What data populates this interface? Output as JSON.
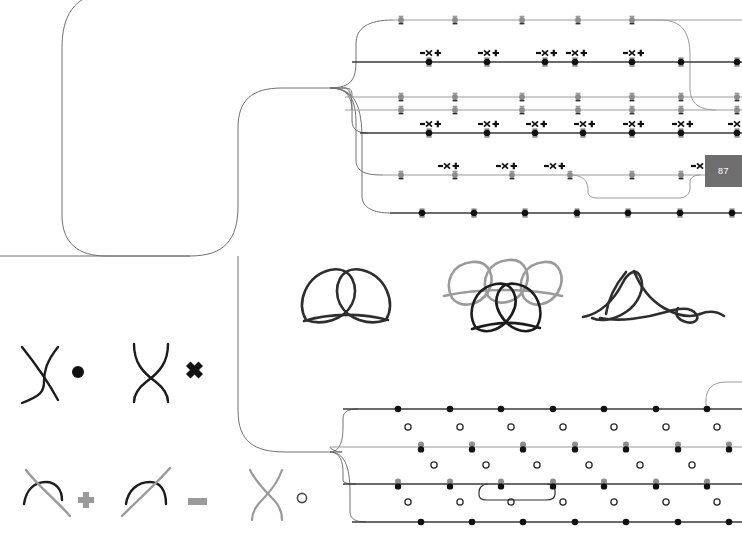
{
  "diagram": {
    "background": "#ffffff",
    "colors": {
      "track_dark": "#3a3a3a",
      "track_light": "#9a9a9a",
      "connector": "#707070",
      "marker_dark": "#1a1a1a",
      "marker_gray": "#8c8c8c",
      "glyph_dark": "#111111",
      "glyph_gray": "#9a9a9a",
      "badge_fill": "#6e6e6e",
      "badge_text": "#ffffff",
      "open_circle": "#2a2a2a"
    }
  },
  "badge": {
    "label": "87",
    "x": 705,
    "y": 155,
    "width": 37,
    "height": 32
  },
  "legend": {
    "rows": [
      {
        "entries": [
          {
            "name": "crossing-over-dark",
            "symbol": "dot",
            "symbol_char": "●",
            "tone": "dark"
          },
          {
            "name": "crossing-under-dark",
            "symbol": "cross",
            "symbol_char": "✖",
            "tone": "dark"
          }
        ]
      },
      {
        "entries": [
          {
            "name": "crossing-plus",
            "symbol": "plus",
            "symbol_char": "✚",
            "tone": "mixed"
          },
          {
            "name": "crossing-minus",
            "symbol": "minus",
            "symbol_char": "➖",
            "tone": "gray"
          },
          {
            "name": "crossing-open",
            "symbol": "open-circle",
            "symbol_char": "○",
            "tone": "gray"
          }
        ]
      }
    ]
  },
  "knots": [
    {
      "name": "knot-two-loop",
      "label": "",
      "tone": "dark"
    },
    {
      "name": "knot-stacked-five",
      "label": "",
      "tone": "mixed"
    },
    {
      "name": "knot-tangle",
      "label": "",
      "tone": "dark"
    }
  ],
  "tracks": {
    "top_group": [
      {
        "name": "track-top-1",
        "y": 20,
        "x1": 393,
        "x2": 742,
        "tone": "light",
        "markers": [
          401,
          455,
          522,
          578,
          632
        ],
        "glyphs": []
      },
      {
        "name": "track-top-2",
        "y": 62,
        "x1": 352,
        "x2": 742,
        "tone": "dark",
        "markers": [
          429,
          487,
          545,
          575,
          632,
          681,
          737
        ],
        "glyphs": [
          429,
          487,
          545,
          575,
          632
        ]
      },
      {
        "name": "track-top-3",
        "y": 97,
        "x1": 345,
        "x2": 742,
        "tone": "light",
        "markers": [
          401,
          455,
          522,
          578,
          632,
          681,
          737
        ],
        "glyphs": []
      },
      {
        "name": "track-top-4",
        "y": 110,
        "x1": 345,
        "x2": 742,
        "tone": "light",
        "markers": [
          401,
          455,
          522,
          578,
          632,
          681,
          737
        ],
        "glyphs": []
      },
      {
        "name": "track-top-5",
        "y": 133,
        "x1": 360,
        "x2": 742,
        "tone": "dark",
        "markers": [
          429,
          487,
          535,
          583,
          632,
          681,
          737
        ],
        "glyphs": [
          429,
          487,
          535,
          583,
          632,
          681,
          737
        ]
      },
      {
        "name": "track-top-6",
        "y": 175,
        "x1": 383,
        "x2": 705,
        "tone": "light",
        "markers": [
          401,
          455,
          512,
          570,
          632,
          681
        ],
        "glyphs": [
          447,
          505,
          553,
          700
        ]
      },
      {
        "name": "track-top-7",
        "y": 213,
        "x1": 390,
        "x2": 742,
        "tone": "dark",
        "markers": [
          422,
          474,
          525,
          577,
          628,
          680,
          732
        ],
        "glyphs": []
      }
    ],
    "bottom_group": [
      {
        "name": "track-bottom-1",
        "y": 409,
        "x1": 343,
        "x2": 742,
        "tone": "dark",
        "markers": [
          398,
          450,
          501,
          553,
          604,
          656,
          707
        ],
        "glyphs": []
      },
      {
        "name": "track-bottom-2",
        "y": 447,
        "x1": 330,
        "x2": 742,
        "tone": "light",
        "markers": [
          421,
          472,
          523,
          575,
          626,
          678,
          729
        ],
        "glyphs": []
      },
      {
        "name": "track-bottom-3",
        "y": 484,
        "x1": 343,
        "x2": 742,
        "tone": "dark",
        "markers": [
          398,
          450,
          501,
          553,
          604,
          656,
          707
        ],
        "glyphs": []
      },
      {
        "name": "track-bottom-4",
        "y": 522,
        "x1": 352,
        "x2": 742,
        "tone": "dark",
        "markers": [
          421,
          472,
          523,
          575,
          626,
          678,
          729
        ],
        "glyphs": []
      }
    ],
    "open_circle_rows": [
      {
        "name": "open-circles-row-1",
        "y": 427,
        "xs": [
          408,
          460,
          511,
          563,
          614,
          666,
          717
        ]
      },
      {
        "name": "open-circles-row-2",
        "y": 465,
        "xs": [
          434,
          486,
          537,
          589,
          640,
          692
        ]
      },
      {
        "name": "open-circles-row-3",
        "y": 502,
        "xs": [
          408,
          460,
          511,
          563,
          614,
          666,
          717
        ]
      }
    ]
  },
  "glyph_cluster": {
    "parts": [
      "minus",
      "cross",
      "plus"
    ],
    "chars": [
      "➖",
      "✖",
      "✚"
    ]
  }
}
